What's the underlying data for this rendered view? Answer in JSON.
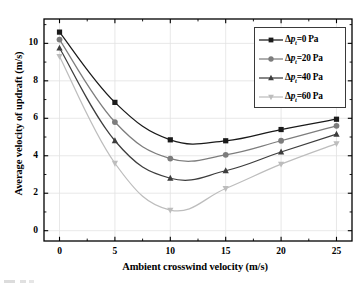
{
  "chart_data": {
    "type": "line",
    "title": "",
    "xlabel": "Ambient crosswind velocity (m/s)",
    "ylabel": "Average velocity of updraft (m/s)",
    "x": [
      0,
      5,
      10,
      15,
      20,
      25
    ],
    "xlim": [
      -1.4,
      26.4
    ],
    "ylim": [
      -0.55,
      11.3
    ],
    "xticks": [
      "0",
      "5",
      "10",
      "15",
      "20",
      "25"
    ],
    "yticks": [
      "0",
      "2",
      "4",
      "6",
      "8",
      "10"
    ],
    "x_minor_ticks": true,
    "y_minor_ticks": true,
    "grid": true,
    "grid_color": "#e2e2e2",
    "legend_position": "top-right",
    "frame": true,
    "series": [
      {
        "name": "Δp_t=0 Pa",
        "label_prefix": "Δ",
        "label_symbol": "p",
        "label_sub": "t",
        "label_suffix": "=0 Pa",
        "marker": "square",
        "color": "#1a1a1a",
        "values": [
          10.6,
          6.85,
          4.85,
          4.8,
          5.4,
          5.95
        ]
      },
      {
        "name": "Δp_t=20 Pa",
        "label_prefix": "Δ",
        "label_symbol": "p",
        "label_sub": "t",
        "label_suffix": "=20 Pa",
        "marker": "circle",
        "color": "#7d7d7d",
        "values": [
          10.2,
          5.8,
          3.85,
          4.05,
          4.8,
          5.6
        ]
      },
      {
        "name": "Δp_t=40 Pa",
        "label_prefix": "Δ",
        "label_symbol": "p",
        "label_sub": "t",
        "label_suffix": "=40 Pa",
        "marker": "triangle-up",
        "color": "#3d3d3d",
        "values": [
          9.75,
          4.8,
          2.8,
          3.2,
          4.2,
          5.15
        ]
      },
      {
        "name": "Δp_t=60 Pa",
        "label_prefix": "Δ",
        "label_symbol": "p",
        "label_sub": "t",
        "label_suffix": "=60 Pa",
        "marker": "triangle-down",
        "color": "#bdbdbd",
        "values": [
          9.3,
          3.6,
          1.1,
          2.25,
          3.55,
          4.65
        ]
      }
    ]
  }
}
